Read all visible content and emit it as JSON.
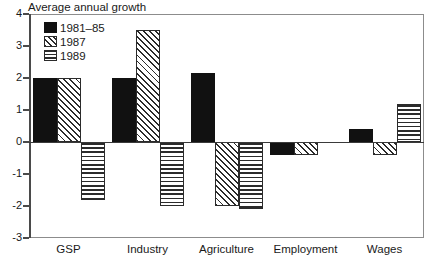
{
  "chart_data": {
    "type": "bar",
    "title": "Average annual growth",
    "subtitle": "",
    "xlabel": "",
    "ylabel": "",
    "grid": false,
    "legend_position": "top-left-inside",
    "ylim": [
      -3,
      4
    ],
    "yticks": [
      4,
      3,
      2,
      1,
      0,
      -1,
      -2,
      -3
    ],
    "ytick_labels": [
      "4",
      "3",
      "2",
      "1",
      "0",
      "-1",
      "-2",
      "-3"
    ],
    "categories": [
      "GSP",
      "Industry",
      "Agriculture",
      "Employment",
      "Wages"
    ],
    "series": [
      {
        "name": "1981–85",
        "values": [
          2.0,
          2.0,
          2.15,
          -0.4,
          0.4
        ]
      },
      {
        "name": "1987",
        "values": [
          2.0,
          3.5,
          -2.0,
          -0.4,
          -0.4
        ]
      },
      {
        "name": "1989",
        "values": [
          -1.8,
          -2.0,
          -2.1,
          null,
          1.2
        ]
      }
    ],
    "colors": {
      "series_1981_85": "#111111",
      "series_1987": "#ffffff",
      "series_1989": "#ffffff",
      "axis": "#4a4a4a",
      "frame": "#8c8c8c",
      "text": "#1a1a1a",
      "background": "#ffffff"
    },
    "annotations": []
  },
  "legend": {
    "entries": [
      {
        "label": "1981–85",
        "pattern": "solid-black"
      },
      {
        "label": "1987",
        "pattern": "diagonal-hatch"
      },
      {
        "label": "1989",
        "pattern": "horizontal-lines"
      }
    ]
  }
}
